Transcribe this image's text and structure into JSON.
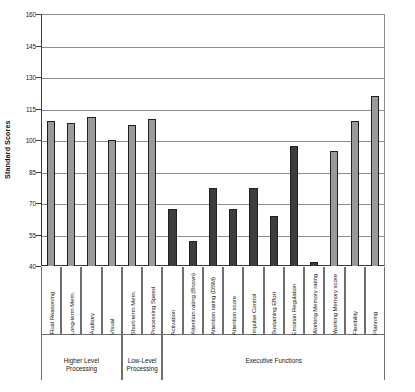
{
  "chart_data": {
    "type": "bar",
    "title": "",
    "xlabel": "",
    "ylabel": "Standard Scores",
    "ylim": [
      40,
      160
    ],
    "yticks": [
      40,
      55,
      70,
      85,
      100,
      115,
      130,
      145,
      160
    ],
    "grid": true,
    "legend_position": "none",
    "colors": {
      "light_bar": "#9a9a9a",
      "dark_bar": "#3d3d3d",
      "bar_outline": "#1f1f1f",
      "gridline": "#8d8d8d",
      "axis": "#3a3a3a"
    },
    "categories": [
      "Fluid Reasoning",
      "Long-term Mem.",
      "Auditory",
      "Visual",
      "Short-term Mem.",
      "Processing Speed",
      "Activation",
      "Attention rating (Brown)",
      "Attention rating (DSM)",
      "Attention score",
      "Impulse Control",
      "Sustaining Effort",
      "Emotion Regulation",
      "Working Memory rating",
      "Working Memory score",
      "Flexibility",
      "Planning"
    ],
    "values": [
      109,
      108,
      111,
      100,
      107,
      110,
      67,
      52,
      77,
      67,
      77,
      64,
      97,
      42,
      95,
      109,
      121
    ],
    "bar_shades": [
      "light",
      "light",
      "light",
      "light",
      "light",
      "light",
      "dark",
      "dark",
      "dark",
      "dark",
      "dark",
      "dark",
      "dark",
      "dark",
      "light",
      "light",
      "light"
    ],
    "groups": [
      {
        "label": "Higher Level\nProcessing",
        "start": 0,
        "end": 3
      },
      {
        "label": "Low-Level\nProcessing",
        "start": 4,
        "end": 5
      },
      {
        "label": "Executive Functions",
        "start": 6,
        "end": 16
      }
    ]
  }
}
